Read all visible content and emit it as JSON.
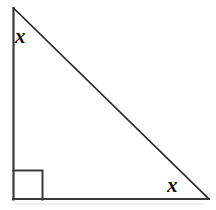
{
  "figure": {
    "type": "right-triangle-diagram",
    "width": 216,
    "height": 210,
    "background_color": "#ffffff",
    "stroke_color": "#3a3a3a",
    "stroke_color_dark": "#2b2b2b",
    "label_color": "#111111"
  },
  "shape": {
    "name": "right triangle",
    "vertices": {
      "apex": {
        "x": 13,
        "y": 8
      },
      "right_angle": {
        "x": 13,
        "y": 199
      },
      "base_right": {
        "x": 209,
        "y": 199
      }
    },
    "sides": {
      "vertical_leg": {
        "from": "apex",
        "to": "right_angle"
      },
      "horizontal_leg": {
        "from": "right_angle",
        "to": "base_right"
      },
      "hypotenuse": {
        "from": "apex",
        "to": "base_right"
      }
    },
    "right_angle_marker": {
      "corner": {
        "x": 13,
        "y": 199
      },
      "size": 29
    }
  },
  "labels": {
    "top_angle": "x",
    "bottom_angle": "x"
  }
}
